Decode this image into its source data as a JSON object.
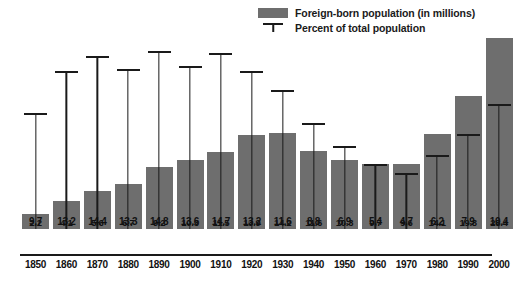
{
  "legend": {
    "series_label": "Foreign-born population (in millions)",
    "tick_label": "Percent of total population",
    "swatch_name": "bar-swatch",
    "tick_name": "percent-tick-marker",
    "bar_color": "#6e6e6e",
    "line_color": "#1a1a1a"
  },
  "chart_data": {
    "type": "bar",
    "title": "",
    "subtitle": "",
    "xlabel": "",
    "ylabel": "",
    "grid": false,
    "legend_position": "top-right",
    "categories": [
      "1850",
      "1860",
      "1870",
      "1880",
      "1890",
      "1900",
      "1910",
      "1920",
      "1930",
      "1940",
      "1950",
      "1960",
      "1970",
      "1980",
      "1990",
      "2000"
    ],
    "series": [
      {
        "name": "Foreign-born population (in millions)",
        "type": "bar",
        "color": "#6e6e6e",
        "values": [
          2.2,
          4.1,
          5.6,
          6.7,
          9.2,
          10.3,
          11.5,
          13.9,
          14.2,
          11.6,
          10.3,
          9.7,
          9.6,
          14.1,
          19.8,
          28.4
        ],
        "ylim": [
          0,
          30
        ]
      },
      {
        "name": "Percent of total population",
        "type": "marker",
        "color": "#1a1a1a",
        "values": [
          9.7,
          13.2,
          14.4,
          13.3,
          14.8,
          13.6,
          14.7,
          13.2,
          11.6,
          8.8,
          6.9,
          5.4,
          4.7,
          6.2,
          7.9,
          10.4
        ],
        "ylim": [
          0,
          16
        ]
      }
    ]
  }
}
